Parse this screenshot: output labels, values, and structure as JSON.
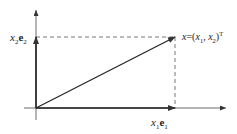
{
  "diagram": {
    "type": "vector-decomposition",
    "labels": {
      "y_component": {
        "base": "x",
        "sub1": "2",
        "vec": "e",
        "sub2": "2"
      },
      "x_component": {
        "base": "x",
        "sub1": "1",
        "vec": "e",
        "sub2": "1"
      },
      "point": {
        "lhs": "x",
        "eq": "=(",
        "x1": "x",
        "x1_sub": "1",
        "comma": ", ",
        "x2": "x",
        "x2_sub": "2",
        "close": ")",
        "sup": "T"
      }
    },
    "colors": {
      "stroke": "#333333",
      "dash": "#555555",
      "background": "#ffffff"
    }
  }
}
